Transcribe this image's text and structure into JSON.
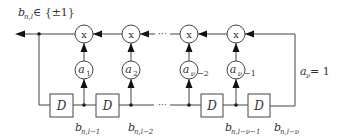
{
  "diagram": {
    "output_label": {
      "base": "b",
      "sub": "n,l",
      "rest": " ∈ {±1}"
    },
    "multiplier_symbol": "x",
    "multipliers": [
      {
        "id": "m1",
        "cx": 84
      },
      {
        "id": "m2",
        "cx": 131
      },
      {
        "id": "m3",
        "cx": 189
      },
      {
        "id": "m4",
        "cx": 236
      }
    ],
    "coefficients": [
      {
        "base": "a",
        "sub": "1",
        "suffix": ""
      },
      {
        "base": "a",
        "sub": "2",
        "suffix": ""
      },
      {
        "base": "a",
        "sub": "ν",
        "suffix": "−2"
      },
      {
        "base": "a",
        "sub": "ν",
        "suffix": "−1"
      }
    ],
    "delay_label": "D",
    "delays": [
      {
        "id": "d1",
        "x": 50
      },
      {
        "id": "d2",
        "x": 96
      },
      {
        "id": "d3",
        "x": 201
      },
      {
        "id": "d4",
        "x": 248
      }
    ],
    "tap_labels": [
      {
        "base": "b",
        "sub": "n,l−1"
      },
      {
        "base": "b",
        "sub": "n,l−2"
      },
      {
        "base": "b",
        "sub": "n,l−ν−1"
      },
      {
        "base": "b",
        "sub": "n,l−ν"
      }
    ],
    "feedback_label": {
      "base": "a",
      "sub": "ν",
      "rest": " = 1"
    },
    "ellipsis": "···",
    "colors": {
      "line": "#444444",
      "text": "#333333",
      "arrow": "#111111"
    }
  }
}
